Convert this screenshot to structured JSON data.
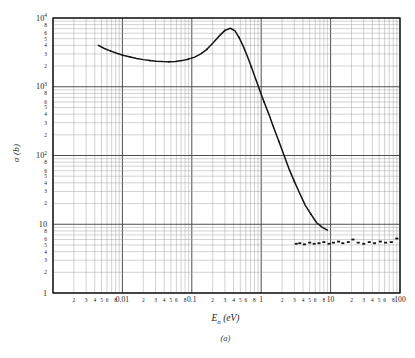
{
  "figure": {
    "caption": "(a)",
    "y_axis_title": "σ (b)",
    "x_axis_title_main": "E",
    "x_axis_title_sub": "n",
    "x_axis_title_unit": " (eV)"
  },
  "chart_data": {
    "type": "line",
    "title": "",
    "subtitle": "",
    "caption": "(a)",
    "xlabel": "E_n (eV)",
    "ylabel": "σ (b)",
    "xscale": "log",
    "yscale": "log",
    "xlim": [
      0.001,
      100
    ],
    "ylim": [
      1,
      10000
    ],
    "grid": true,
    "minor_grid": true,
    "legend": "none",
    "x_decade_labels": [
      "0.01",
      "0.1",
      "1",
      "10",
      "100"
    ],
    "x_decade_values": [
      0.01,
      0.1,
      1,
      10,
      100
    ],
    "x_minor_labels": [
      "2",
      "3",
      "4",
      "5",
      "6",
      "8"
    ],
    "y_decade_labels": [
      "10⁴",
      "10³",
      "10²",
      "10",
      "1"
    ],
    "y_decade_values": [
      10000,
      1000,
      100,
      10,
      1
    ],
    "y_minor_labels": [
      "8",
      "6",
      "5",
      "4",
      "3",
      "2"
    ],
    "series": [
      {
        "name": "cross-section-curve",
        "style": "line",
        "x": [
          0.0045,
          0.0055,
          0.0068,
          0.0085,
          0.0105,
          0.013,
          0.016,
          0.02,
          0.025,
          0.031,
          0.038,
          0.047,
          0.058,
          0.072,
          0.089,
          0.11,
          0.135,
          0.165,
          0.2,
          0.245,
          0.3,
          0.36,
          0.42,
          0.48,
          0.55,
          0.63,
          0.72,
          0.82,
          0.95,
          1.1,
          1.3,
          1.5,
          1.8,
          2.1,
          2.5,
          3.0,
          3.6,
          4.3,
          5.2,
          6.3,
          7.6,
          9.0
        ],
        "y": [
          4000,
          3600,
          3300,
          3050,
          2850,
          2700,
          2580,
          2480,
          2400,
          2350,
          2320,
          2310,
          2330,
          2400,
          2520,
          2700,
          3000,
          3500,
          4300,
          5400,
          6600,
          7100,
          6500,
          5200,
          3900,
          2800,
          1950,
          1350,
          900,
          600,
          390,
          260,
          160,
          105,
          65,
          42,
          28,
          19,
          14,
          10.5,
          9.0,
          8.2
        ]
      },
      {
        "name": "flat-tail-points",
        "style": "points",
        "x": [
          3.2,
          3.6,
          4.2,
          5.0,
          5.8,
          6.8,
          8.0,
          9.5,
          11,
          13,
          15,
          18,
          21,
          25,
          30,
          36,
          43,
          52,
          62,
          75,
          90
        ],
        "y": [
          5.2,
          5.3,
          5.1,
          5.4,
          5.2,
          5.3,
          5.5,
          5.2,
          5.4,
          5.6,
          5.3,
          5.5,
          6.0,
          5.4,
          5.2,
          5.5,
          5.3,
          5.6,
          5.4,
          5.5,
          6.2
        ]
      }
    ]
  }
}
